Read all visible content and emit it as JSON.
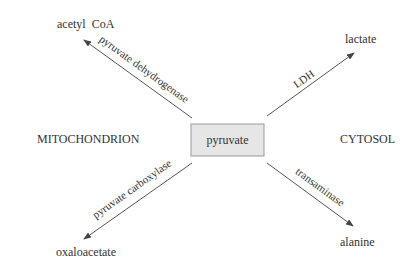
{
  "diagram": {
    "center": {
      "label": "pyruvate",
      "fill": "#e6e6e6",
      "stroke": "#999999"
    },
    "regions": {
      "left": "MITOCHONDRION",
      "right": "CYTOSOL"
    },
    "products": {
      "acetyl_coa": "acetyl  CoA",
      "lactate": "lactate",
      "oxaloacetate": "oxaloacetate",
      "alanine": "alanine"
    },
    "enzymes": {
      "pdh": "pyruvate  dehydrogenase",
      "ldh": "LDH",
      "pc": "pyruvate  carboxylase",
      "transaminase": "transaminase"
    },
    "arrow_color": "#555555"
  }
}
